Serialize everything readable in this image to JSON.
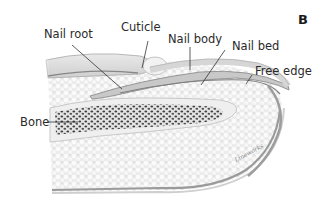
{
  "figure": {
    "panel_letter": "B",
    "signature": "Lineworks"
  },
  "labels": {
    "nail_root": "Nail root",
    "cuticle": "Cuticle",
    "nail_body": "Nail body",
    "nail_bed": "Nail bed",
    "free_edge": "Free edge",
    "bone": "Bone"
  },
  "colors": {
    "tissue": "#eeeeee",
    "tissue_dots": "#ffffff",
    "nail": "#c9c9c9",
    "nail_edge": "#8f8f8f",
    "bone_fill": "#e6e6e6",
    "bone_pores": "#3d3d3d",
    "skin_fold": "#dcdcdc",
    "leader": "#333333"
  }
}
